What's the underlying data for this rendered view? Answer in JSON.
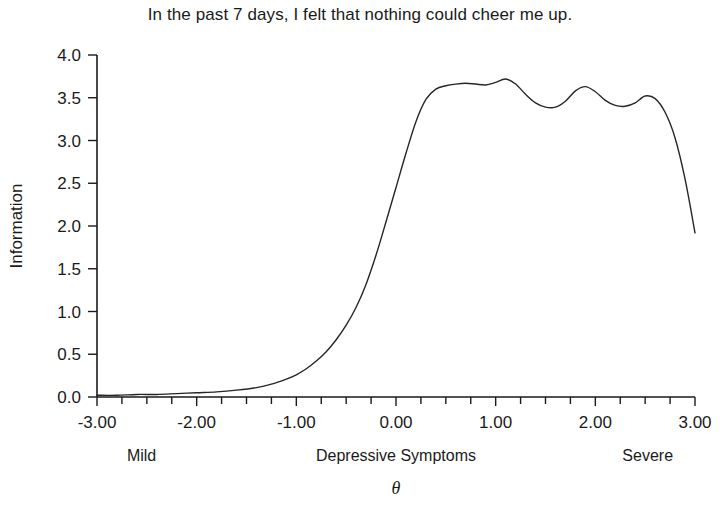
{
  "chart_data": {
    "type": "line",
    "title": "In the past 7 days, I felt that nothing could cheer me up.",
    "xlabel": "Depressive Symptoms",
    "xlabel_secondary": "θ",
    "ylabel": "Information",
    "xlim": [
      -3.0,
      3.0
    ],
    "ylim": [
      0.0,
      4.0
    ],
    "grid": false,
    "legend": false,
    "x_major_ticks": [
      -3.0,
      -2.0,
      -1.0,
      0.0,
      1.0,
      2.0,
      3.0
    ],
    "x_tick_labels": [
      "-3.00",
      "-2.00",
      "-1.00",
      "0.00",
      "1.00",
      "2.00",
      "3.00"
    ],
    "x_minor_tick_step": 0.25,
    "y_major_ticks": [
      0.0,
      0.5,
      1.0,
      1.5,
      2.0,
      2.5,
      3.0,
      3.5,
      4.0
    ],
    "y_tick_labels": [
      "0.0",
      "0.5",
      "1.0",
      "1.5",
      "2.0",
      "2.5",
      "3.0",
      "3.5",
      "4.0"
    ],
    "annotations": [
      {
        "name": "left-anchor",
        "text": "Mild",
        "x": -2.7
      },
      {
        "name": "center-anchor",
        "text": "Depressive Symptoms",
        "x": 0.0
      },
      {
        "name": "right-anchor",
        "text": "Severe",
        "x": 2.78
      }
    ],
    "line_color": "#262626",
    "line_width": 1.4,
    "series": [
      {
        "name": "Information",
        "x": [
          -3.0,
          -2.8,
          -2.6,
          -2.4,
          -2.2,
          -2.0,
          -1.8,
          -1.6,
          -1.4,
          -1.25,
          -1.1,
          -1.0,
          -0.9,
          -0.8,
          -0.7,
          -0.6,
          -0.5,
          -0.4,
          -0.3,
          -0.2,
          -0.1,
          0.0,
          0.1,
          0.2,
          0.3,
          0.4,
          0.5,
          0.6,
          0.7,
          0.8,
          0.9,
          1.0,
          1.1,
          1.2,
          1.3,
          1.4,
          1.5,
          1.6,
          1.7,
          1.8,
          1.9,
          2.0,
          2.1,
          2.2,
          2.3,
          2.4,
          2.5,
          2.6,
          2.7,
          2.8,
          2.9,
          3.0
        ],
        "y": [
          0.02,
          0.02,
          0.03,
          0.03,
          0.04,
          0.05,
          0.06,
          0.08,
          0.11,
          0.15,
          0.21,
          0.26,
          0.33,
          0.42,
          0.53,
          0.67,
          0.84,
          1.05,
          1.32,
          1.66,
          2.05,
          2.45,
          2.85,
          3.22,
          3.48,
          3.6,
          3.64,
          3.66,
          3.67,
          3.66,
          3.65,
          3.68,
          3.72,
          3.66,
          3.54,
          3.44,
          3.39,
          3.39,
          3.46,
          3.58,
          3.63,
          3.57,
          3.47,
          3.41,
          3.4,
          3.44,
          3.52,
          3.49,
          3.33,
          3.03,
          2.55,
          1.92
        ]
      }
    ]
  }
}
